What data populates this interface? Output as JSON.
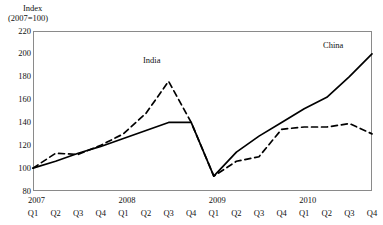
{
  "axis_title": {
    "line1": "Index",
    "line2": "(2007=100)"
  },
  "series_labels": {
    "india": "India",
    "china": "China"
  },
  "y_ticks": [
    "220",
    "200",
    "180",
    "160",
    "140",
    "120",
    "100",
    "80"
  ],
  "x_years": [
    "2007",
    "2008",
    "2009",
    "2010"
  ],
  "x_quarters": [
    "Q1",
    "Q2",
    "Q3",
    "Q4",
    "Q1",
    "Q2",
    "Q3",
    "Q4",
    "Q1",
    "Q2",
    "Q3",
    "Q4",
    "Q1",
    "Q2",
    "Q3",
    "Q4"
  ],
  "colors": {
    "line": "#000000",
    "frame": "#8a8a8a",
    "text": "#111111",
    "background": "#ffffff"
  },
  "chart_data": {
    "type": "line",
    "title": "",
    "xlabel": "",
    "ylabel": "Index (2007=100)",
    "ylim": [
      80,
      220
    ],
    "grid": false,
    "legend_position": "inline-annotation",
    "categories": [
      "2007 Q1",
      "2007 Q2",
      "2007 Q3",
      "2007 Q4",
      "2008 Q1",
      "2008 Q2",
      "2008 Q3",
      "2008 Q4",
      "2009 Q1",
      "2009 Q2",
      "2009 Q3",
      "2009 Q4",
      "2010 Q1",
      "2010 Q2",
      "2010 Q3",
      "2010 Q4"
    ],
    "series": [
      {
        "name": "China",
        "style": "solid",
        "values": [
          100,
          106,
          113,
          119,
          126,
          133,
          140,
          140,
          93,
          114,
          128,
          140,
          152,
          162,
          180,
          200
        ]
      },
      {
        "name": "India",
        "style": "dashed",
        "values": [
          100,
          113,
          112,
          120,
          130,
          148,
          176,
          140,
          93,
          106,
          110,
          134,
          136,
          136,
          139,
          130
        ]
      }
    ]
  }
}
